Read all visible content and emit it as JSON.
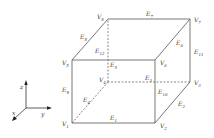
{
  "diagram": {
    "type": "cube",
    "vertices": [
      {
        "id": "V1",
        "label": "V",
        "sub": "1",
        "x": 72,
        "y": 123,
        "lx": 62,
        "ly": 126
      },
      {
        "id": "V2",
        "label": "V",
        "sub": "2",
        "x": 155,
        "y": 123,
        "lx": 160,
        "ly": 128
      },
      {
        "id": "V3",
        "label": "V",
        "sub": "3",
        "x": 190,
        "y": 82,
        "lx": 194,
        "ly": 85
      },
      {
        "id": "V4",
        "label": "V",
        "sub": "4",
        "x": 108,
        "y": 82,
        "lx": 99,
        "ly": 82
      },
      {
        "id": "V5",
        "label": "V",
        "sub": "5",
        "x": 72,
        "y": 60,
        "lx": 62,
        "ly": 65
      },
      {
        "id": "V6",
        "label": "V",
        "sub": "6",
        "x": 155,
        "y": 60,
        "lx": 160,
        "ly": 65
      },
      {
        "id": "V7",
        "label": "V",
        "sub": "7",
        "x": 190,
        "y": 19,
        "lx": 194,
        "ly": 22
      },
      {
        "id": "V8",
        "label": "V",
        "sub": "8",
        "x": 108,
        "y": 19,
        "lx": 97,
        "ly": 19
      }
    ],
    "edges": [
      {
        "id": "E1",
        "label": "E",
        "sub": "1",
        "from": "V1",
        "to": "V2",
        "hidden": false,
        "lx": 110,
        "ly": 120
      },
      {
        "id": "E2",
        "label": "E",
        "sub": "2",
        "from": "V2",
        "to": "V3",
        "hidden": false,
        "lx": 178,
        "ly": 106
      },
      {
        "id": "E3",
        "label": "E",
        "sub": "3",
        "from": "V3",
        "to": "V4",
        "hidden": true,
        "lx": 145,
        "ly": 80
      },
      {
        "id": "E4",
        "label": "E",
        "sub": "4",
        "from": "V4",
        "to": "V1",
        "hidden": true,
        "lx": 83,
        "ly": 102
      },
      {
        "id": "E5",
        "label": "E",
        "sub": "5",
        "from": "V5",
        "to": "V6",
        "hidden": false,
        "lx": 110,
        "ly": 67
      },
      {
        "id": "E6",
        "label": "E",
        "sub": "6",
        "from": "V6",
        "to": "V7",
        "hidden": false,
        "lx": 176,
        "ly": 45
      },
      {
        "id": "E7",
        "label": "E",
        "sub": "7",
        "from": "V8",
        "to": "V7",
        "hidden": false,
        "lx": 146,
        "ly": 16
      },
      {
        "id": "E8",
        "label": "E",
        "sub": "8",
        "from": "V5",
        "to": "V8",
        "hidden": false,
        "lx": 80,
        "ly": 39
      },
      {
        "id": "E9",
        "label": "E",
        "sub": "9",
        "from": "V1",
        "to": "V5",
        "hidden": false,
        "lx": 62,
        "ly": 92
      },
      {
        "id": "E10",
        "label": "E",
        "sub": "10",
        "from": "V2",
        "to": "V6",
        "hidden": false,
        "lx": 158,
        "ly": 94
      },
      {
        "id": "E11",
        "label": "E",
        "sub": "11",
        "from": "V3",
        "to": "V7",
        "hidden": false,
        "lx": 194,
        "ly": 54
      },
      {
        "id": "E12",
        "label": "E",
        "sub": "12",
        "from": "V4",
        "to": "V8",
        "hidden": true,
        "lx": 95,
        "ly": 53
      }
    ]
  },
  "axes": {
    "origin": {
      "x": 26,
      "y": 108
    },
    "x_label": "x",
    "y_label": "y",
    "z_label": "z"
  }
}
